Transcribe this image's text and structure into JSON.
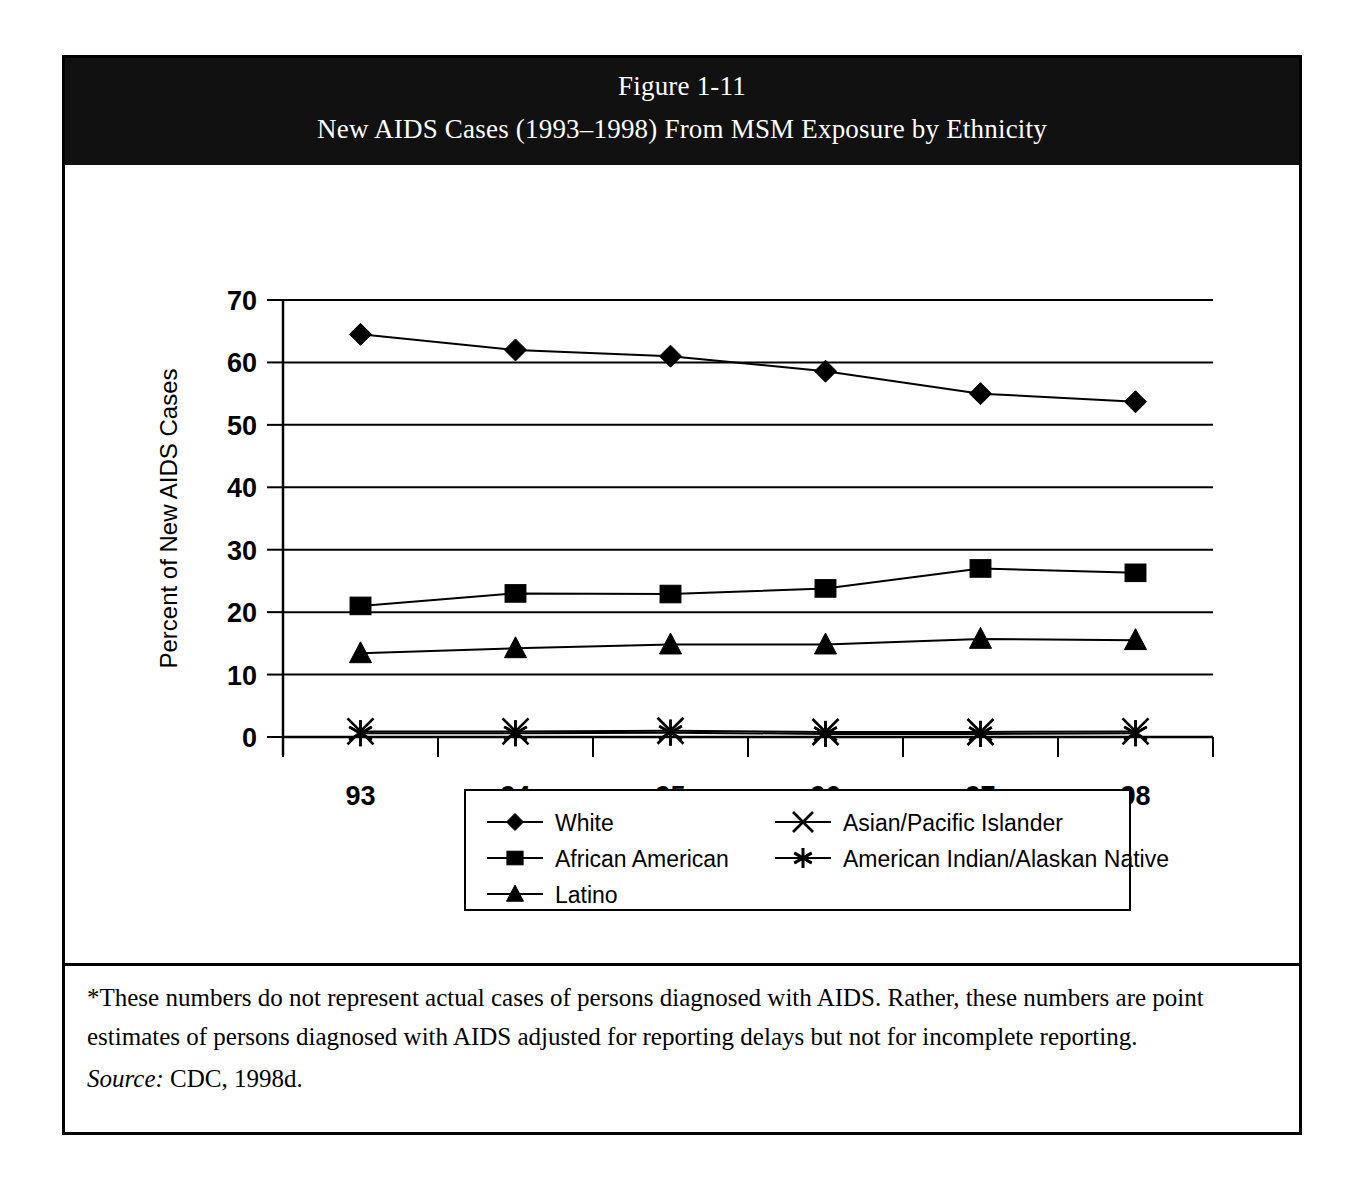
{
  "figure": {
    "title_line1": "Figure 1-11",
    "title_line2": "New AIDS Cases (1993–1998) From MSM Exposure by Ethnicity",
    "footnote": "*These numbers do not represent actual cases of persons diagnosed with AIDS.  Rather, these numbers are point estimates of persons diagnosed with AIDS adjusted for reporting delays but not for incomplete reporting.",
    "source_label": "Source:",
    "source_value": "CDC, 1998d.",
    "frame_color": "#000000",
    "banner_bg": "#111111",
    "banner_fg": "#ffffff"
  },
  "chart_data": {
    "type": "line",
    "title": "New AIDS Cases (1993–1998) From MSM Exposure by Ethnicity",
    "xlabel": "Year of Report",
    "ylabel": "Percent of New AIDS Cases",
    "categories": [
      "93",
      "94",
      "95",
      "96",
      "97",
      "98"
    ],
    "ylim": [
      0,
      70
    ],
    "yticks": [
      0,
      10,
      20,
      30,
      40,
      50,
      60,
      70
    ],
    "grid": "horizontal",
    "legend_position": "bottom",
    "series": [
      {
        "name": "White",
        "marker": "diamond",
        "values": [
          64.5,
          62.0,
          61.0,
          58.6,
          55.0,
          53.7
        ]
      },
      {
        "name": "African American",
        "marker": "square",
        "values": [
          21.0,
          23.0,
          22.9,
          23.8,
          27.0,
          26.3
        ]
      },
      {
        "name": "Latino",
        "marker": "triangle",
        "values": [
          13.4,
          14.2,
          14.8,
          14.8,
          15.7,
          15.5
        ]
      },
      {
        "name": "Asian/Pacific Islander",
        "marker": "cross",
        "values": [
          0.9,
          0.9,
          1.0,
          0.8,
          0.8,
          0.9
        ]
      },
      {
        "name": "American Indian/Alaskan Native",
        "marker": "asterisk",
        "values": [
          0.6,
          0.6,
          0.7,
          0.5,
          0.5,
          0.6
        ]
      }
    ]
  }
}
